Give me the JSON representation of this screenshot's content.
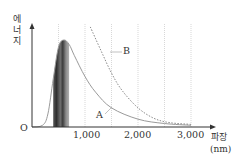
{
  "chart_data": {
    "type": "line",
    "title": "",
    "xlabel": "파장 (nm)",
    "ylabel": "에너지",
    "xlim": [
      0,
      3300
    ],
    "ylim": [
      0,
      1
    ],
    "grid": "vertical dotted lines every 500 nm",
    "x_ticks": [
      "1,000",
      "2,000",
      "3,000"
    ],
    "x_tick_values": [
      1000,
      2000,
      3000
    ],
    "origin_label": "O",
    "legend": "none (curves labeled inline)",
    "series": [
      {
        "name": "A",
        "style": "solid gray",
        "x": [
          0,
          200,
          300,
          400,
          500,
          600,
          700,
          800,
          1000,
          1200,
          1500,
          2000,
          2500,
          3000
        ],
        "values": [
          0,
          0.02,
          0.15,
          0.55,
          0.92,
          1.0,
          0.95,
          0.82,
          0.58,
          0.4,
          0.22,
          0.09,
          0.04,
          0.02
        ]
      },
      {
        "name": "B",
        "style": "dashed gray",
        "x": [
          1100,
          1300,
          1500,
          1700,
          2000,
          2300,
          2600,
          3000
        ],
        "values": [
          1.15,
          0.88,
          0.62,
          0.42,
          0.22,
          0.1,
          0.05,
          0.03
        ]
      }
    ],
    "annotations": [
      {
        "type": "band",
        "label": "visible spectrum band",
        "x_range": [
          400,
          700
        ]
      }
    ]
  },
  "axis": {
    "ylabel_chars": [
      "에",
      "너",
      "지"
    ],
    "xlabel_main": "파장",
    "xlabel_unit": "(nm)",
    "origin": "O",
    "ticks": [
      "1,000",
      "2,000",
      "3,000"
    ]
  },
  "curve_labels": {
    "a": "A",
    "b": "B"
  },
  "colors": {
    "axis": "#333333",
    "curve_a": "#9a9a9a",
    "curve_b": "#8a8a8a",
    "grid": "#bdbdbd",
    "band_dark": "#3a3a3a",
    "band_light": "#9a9a9a"
  }
}
